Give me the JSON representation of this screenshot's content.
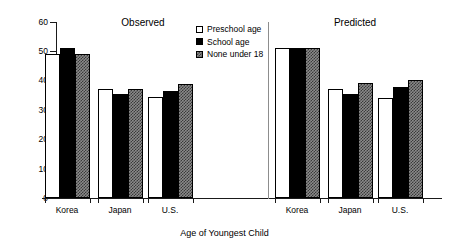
{
  "chart_data": {
    "type": "bar",
    "title": "",
    "xlabel": "Age of Youngest Child",
    "ylabel": "Percent",
    "ylim": [
      0,
      60
    ],
    "yticks": [
      0,
      10,
      20,
      30,
      40,
      50,
      60
    ],
    "grid": false,
    "legend_position": "top-center",
    "panels": [
      {
        "name": "Observed",
        "categories": [
          "Korea",
          "Japan",
          "U.S."
        ],
        "series": [
          {
            "name": "Preschool age",
            "values": [
              49.0,
              37.3,
              34.5
            ]
          },
          {
            "name": "School age",
            "values": [
              51.0,
              35.4,
              36.6
            ]
          },
          {
            "name": "None under 18",
            "values": [
              49.2,
              37.3,
              38.7
            ]
          }
        ]
      },
      {
        "name": "Predicted",
        "categories": [
          "Korea",
          "Japan",
          "U.S."
        ],
        "series": [
          {
            "name": "Preschool age",
            "values": [
              51.0,
              37.1,
              34.2
            ]
          },
          {
            "name": "School age",
            "values": [
              51.0,
              35.3,
              38.0
            ]
          },
          {
            "name": "None under 18",
            "values": [
              51.0,
              39.3,
              40.2
            ]
          }
        ]
      }
    ],
    "legend": [
      "Preschool age",
      "School age",
      "None under 18"
    ],
    "colors": {
      "preschool": "#ffffff",
      "school": "#000000",
      "none_under_18": "#8a8a8a",
      "axis": "#1a1a1a"
    }
  },
  "axis": {
    "y_title": "Percent",
    "x_title": "Age of Youngest Child",
    "y_ticks": [
      "60",
      "50",
      "40",
      "30",
      "20",
      "10",
      "0"
    ]
  },
  "panels": {
    "observed_title": "Observed",
    "predicted_title": "Predicted"
  },
  "legend": {
    "item_0": "Preschool age",
    "item_1": "School age",
    "item_2": "None under 18"
  },
  "categories": {
    "obs_0": "Korea",
    "obs_1": "Japan",
    "obs_2": "U.S.",
    "pred_0": "Korea",
    "pred_1": "Japan",
    "pred_2": "U.S."
  }
}
